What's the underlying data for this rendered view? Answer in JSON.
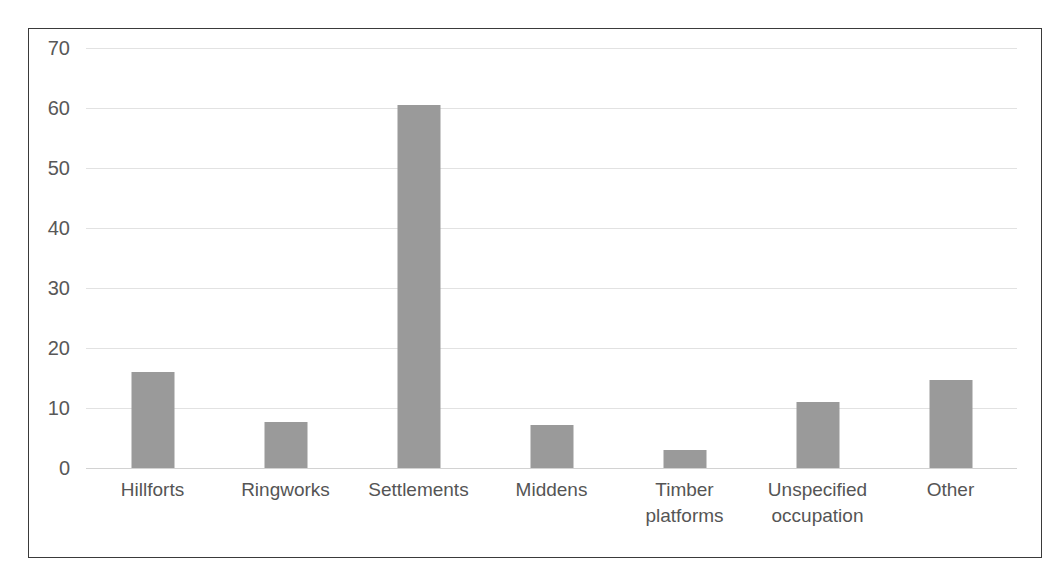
{
  "figure": {
    "clipped_title_remnant": "",
    "frame_color": "#3a3a3a",
    "background": "#ffffff"
  },
  "chart_data": {
    "type": "bar",
    "title": "",
    "xlabel": "",
    "ylabel": "",
    "ylim": [
      0,
      70
    ],
    "ytick_step": 10,
    "yticks": [
      "70",
      "60",
      "50",
      "40",
      "30",
      "20",
      "10",
      "0"
    ],
    "ytick_values": [
      70,
      60,
      50,
      40,
      30,
      20,
      10,
      0
    ],
    "grid": true,
    "legend": false,
    "bar_color": "#9a9a9a",
    "gridline_color": "#e2e2e2",
    "categories": [
      "Hillforts",
      "Ringworks",
      "Settlements",
      "Middens",
      "Timber platforms",
      "Unspecified occupation",
      "Other"
    ],
    "category_lines": [
      [
        "Hillforts"
      ],
      [
        "Ringworks"
      ],
      [
        "Settlements"
      ],
      [
        "Middens"
      ],
      [
        "Timber",
        "platforms"
      ],
      [
        "Unspecified",
        "occupation"
      ],
      [
        "Other"
      ]
    ],
    "values": [
      16,
      7.7,
      60.5,
      7.2,
      3,
      11,
      14.6
    ]
  }
}
